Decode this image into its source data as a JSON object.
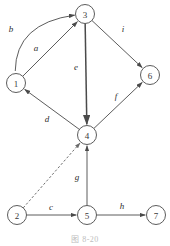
{
  "figure": {
    "caption": "图 8-20",
    "caption_x": 0,
    "caption_y": 233
  },
  "graph_data": {
    "type": "diagram",
    "diagram_kind": "directed-graph",
    "node_radius": 9.5,
    "nodes": [
      {
        "id": "1",
        "label": "1",
        "x": 16,
        "y": 83
      },
      {
        "id": "2",
        "label": "2",
        "x": 17,
        "y": 215
      },
      {
        "id": "3",
        "label": "3",
        "x": 85,
        "y": 14
      },
      {
        "id": "4",
        "label": "4",
        "x": 87,
        "y": 135
      },
      {
        "id": "5",
        "label": "5",
        "x": 87,
        "y": 215
      },
      {
        "id": "6",
        "label": "6",
        "x": 150,
        "y": 75
      },
      {
        "id": "7",
        "label": "7",
        "x": 156,
        "y": 215
      }
    ],
    "edges": [
      {
        "id": "b",
        "label": "b",
        "from": "1",
        "to": "3",
        "style": "curved",
        "dashed": false,
        "directed": true,
        "label_x": 11,
        "label_y": 29,
        "curve_cx": 8,
        "curve_cy": 20
      },
      {
        "id": "a",
        "label": "a",
        "from": "1",
        "to": "3",
        "style": "straight",
        "dashed": false,
        "directed": true,
        "label_x": 36,
        "label_y": 48
      },
      {
        "id": "i",
        "label": "i",
        "from": "3",
        "to": "6",
        "style": "straight",
        "dashed": false,
        "directed": true,
        "label_x": 123,
        "label_y": 29
      },
      {
        "id": "e",
        "label": "e",
        "from": "3",
        "to": "4",
        "style": "straight",
        "dashed": false,
        "directed": true,
        "label_x": 76,
        "label_y": 67,
        "weight": "thick"
      },
      {
        "id": "f",
        "label": "f",
        "from": "4",
        "to": "6",
        "style": "straight",
        "dashed": false,
        "directed": true,
        "label_x": 116,
        "label_y": 96
      },
      {
        "id": "d",
        "label": "d",
        "from": "4",
        "to": "1",
        "style": "straight",
        "dashed": false,
        "directed": true,
        "label_x": 47,
        "label_y": 119
      },
      {
        "id": "g",
        "label": "g",
        "from": "5",
        "to": "4",
        "style": "straight",
        "dashed": false,
        "directed": true,
        "label_x": 77,
        "label_y": 177
      },
      {
        "id": "c",
        "label": "c",
        "from": "2",
        "to": "5",
        "style": "straight",
        "dashed": false,
        "directed": true,
        "label_x": 51,
        "label_y": 207
      },
      {
        "id": "h",
        "label": "h",
        "from": "5",
        "to": "7",
        "style": "straight",
        "dashed": false,
        "directed": true,
        "label_x": 122,
        "label_y": 206
      },
      {
        "id": "x",
        "label": "",
        "from": "2",
        "to": "4",
        "style": "straight",
        "dashed": true,
        "directed": true,
        "label_x": 0,
        "label_y": 0
      }
    ]
  },
  "colors": {
    "stroke": "#4a4a4a",
    "node_fill": "#ffffff",
    "label": "#2e2e2e",
    "caption": "#bdbdbd"
  }
}
